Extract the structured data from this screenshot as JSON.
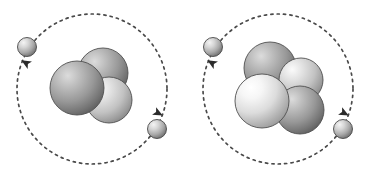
{
  "canvas": {
    "width": 370,
    "height": 177,
    "background": "#ffffff",
    "title": "Atomic structure comparison diagram"
  },
  "palette": {
    "orbit_stroke": "#4a4a4a",
    "arrow_fill": "#2b2b2b",
    "nucleon_dark_highlight": "#d8d8d8",
    "nucleon_dark_mid": "#9a9a9a",
    "nucleon_dark_shadow": "#5e5e5e",
    "nucleon_light_highlight": "#ffffff",
    "nucleon_light_mid": "#d4d4d4",
    "nucleon_light_shadow": "#8a8a8a",
    "nucleon_outline": "#4f4f4f",
    "electron_highlight": "#f2f2f2",
    "electron_mid": "#b5b5b5",
    "electron_shadow": "#6a6a6a",
    "electron_outline": "#4a4a4a",
    "background": "#ffffff"
  },
  "atoms": [
    {
      "id": "atom-left",
      "name": "helium-3-atom",
      "label": "Left atom",
      "nucleon_count": 3,
      "electron_count": 2,
      "orbit": {
        "cx": 92,
        "cy": 89,
        "r": 75,
        "dash": "2.2 4.2",
        "stroke_width": 1.7
      },
      "nucleus": {
        "cx": 92,
        "cy": 89,
        "nucleons": [
          {
            "name": "nucleon-back-top",
            "cx": 103,
            "cy": 73,
            "r": 25,
            "shade": "dark",
            "z": 1
          },
          {
            "name": "nucleon-front-right",
            "cx": 109,
            "cy": 100,
            "r": 23,
            "shade": "light",
            "z": 2
          },
          {
            "name": "nucleon-front-left",
            "cx": 77,
            "cy": 88,
            "r": 27,
            "shade": "dark",
            "z": 3
          }
        ]
      },
      "electrons": [
        {
          "name": "electron-upper-left",
          "cx": 27,
          "cy": 47,
          "r": 9.5
        },
        {
          "name": "electron-lower-right",
          "cx": 157,
          "cy": 129,
          "r": 9.5
        }
      ],
      "arrows": [
        {
          "name": "orbit-arrow-left",
          "x": 26,
          "y": 63,
          "rotate": -60
        },
        {
          "name": "orbit-arrow-right",
          "x": 158,
          "y": 113,
          "rotate": 118
        }
      ]
    },
    {
      "id": "atom-right",
      "name": "helium-4-atom",
      "label": "Right atom",
      "nucleon_count": 4,
      "electron_count": 2,
      "orbit": {
        "cx": 278,
        "cy": 89,
        "r": 75,
        "dash": "2.2 4.2",
        "stroke_width": 1.7
      },
      "nucleus": {
        "cx": 278,
        "cy": 89,
        "nucleons": [
          {
            "name": "nucleon-back-top-left",
            "cx": 270,
            "cy": 68,
            "r": 26,
            "shade": "dark",
            "z": 1
          },
          {
            "name": "nucleon-back-right",
            "cx": 301,
            "cy": 80,
            "r": 22,
            "shade": "light",
            "z": 2
          },
          {
            "name": "nucleon-front-right",
            "cx": 300,
            "cy": 110,
            "r": 24,
            "shade": "dark",
            "z": 3
          },
          {
            "name": "nucleon-front-left",
            "cx": 262,
            "cy": 101,
            "r": 27,
            "shade": "bright",
            "z": 4
          }
        ]
      },
      "electrons": [
        {
          "name": "electron-upper-left",
          "cx": 213,
          "cy": 47,
          "r": 9.5
        },
        {
          "name": "electron-lower-right",
          "cx": 343,
          "cy": 129,
          "r": 9.5
        }
      ],
      "arrows": [
        {
          "name": "orbit-arrow-left",
          "x": 212,
          "y": 63,
          "rotate": -60
        },
        {
          "name": "orbit-arrow-right",
          "x": 344,
          "y": 113,
          "rotate": 118
        }
      ]
    }
  ]
}
